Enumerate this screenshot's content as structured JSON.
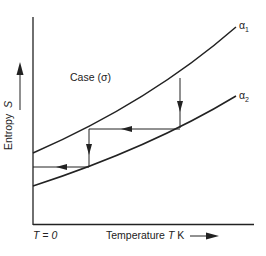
{
  "figure": {
    "case_label": "Case (σ)",
    "curves": [
      {
        "name": "α1",
        "label_main": "α",
        "label_sub": "1"
      },
      {
        "name": "α2",
        "label_main": "α",
        "label_sub": "2"
      }
    ],
    "y_axis": {
      "label": "Entropy",
      "symbol": "S"
    },
    "x_axis": {
      "label": "Temperature",
      "symbol": "T",
      "unit": "K"
    },
    "origin_label": "T = 0",
    "colors": {
      "line": "#222222",
      "background": "#ffffff"
    }
  }
}
